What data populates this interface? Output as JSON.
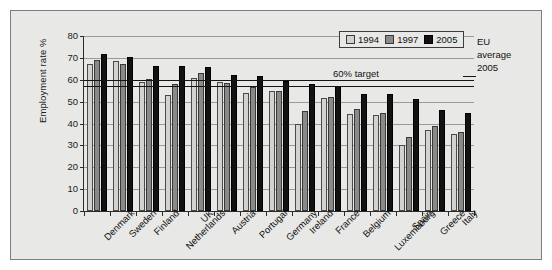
{
  "chart_data": {
    "type": "bar",
    "title": "",
    "xlabel": "",
    "ylabel": "Employment rate %",
    "ylim": [
      0,
      80
    ],
    "ytick_step": 10,
    "yticks": [
      0,
      10,
      20,
      30,
      40,
      50,
      60,
      70,
      80
    ],
    "grid": true,
    "legend_position": "top-right",
    "categories": [
      "Denmark",
      "Sweden",
      "Finland",
      "Netherlands",
      "UK",
      "Austria",
      "Portugal",
      "Germany",
      "Ireland",
      "France",
      "Belgium",
      "Luxembourg",
      "Spain",
      "Greece",
      "Italy"
    ],
    "series": [
      {
        "name": "1994",
        "color": "#d2d2cf",
        "values": [
          67,
          68.5,
          59,
          53,
          61,
          59,
          54,
          55,
          40,
          51.5,
          44.5,
          44,
          30,
          37,
          35
        ]
      },
      {
        "name": "1997",
        "color": "#8a8a88",
        "values": [
          69,
          67,
          60.5,
          58,
          63,
          58.5,
          56.5,
          55,
          45.5,
          52,
          46.5,
          45,
          34,
          39,
          36
        ]
      },
      {
        "name": "2005",
        "color": "#121212",
        "values": [
          72,
          70.5,
          66.5,
          66.5,
          66,
          62,
          61.5,
          59.5,
          58,
          57,
          53.5,
          53.5,
          51,
          46,
          45
        ]
      }
    ],
    "reference_lines": [
      {
        "label": "60% target",
        "value": 60,
        "color": "#151515"
      },
      {
        "label": "EU average 2005",
        "value": 57,
        "color": "#151515"
      }
    ],
    "annotations": {
      "target_label": "60% target",
      "eu_note_lines": [
        "EU",
        "average",
        "2005"
      ]
    }
  },
  "legend": {
    "items": [
      {
        "label": "1994",
        "key": "y1994"
      },
      {
        "label": "1997",
        "key": "y1997"
      },
      {
        "label": "2005",
        "key": "y2005"
      }
    ]
  }
}
